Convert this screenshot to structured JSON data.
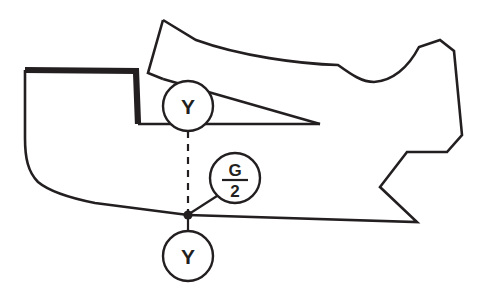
{
  "diagram": {
    "type": "technical-pattern-drawing",
    "background_color": "#ffffff",
    "line_color": "#231f20",
    "callouts": [
      {
        "id": "upper-notch",
        "label": "Y",
        "shape": "circle",
        "center": {
          "x": 188,
          "y": 106
        },
        "radius": 25
      },
      {
        "id": "grainline-half",
        "label_numerator": "G",
        "label_denominator": "2",
        "shape": "circle",
        "center": {
          "x": 235,
          "y": 178
        },
        "radius": 25
      },
      {
        "id": "lower-notch",
        "label": "Y",
        "shape": "circle",
        "center": {
          "x": 188,
          "y": 256
        },
        "radius": 25
      }
    ],
    "connectors": [
      {
        "id": "vertical-dashed",
        "style": "dashed",
        "from": {
          "x": 188,
          "y": 131
        },
        "to": {
          "x": 188,
          "y": 215
        }
      },
      {
        "id": "grain-leader",
        "style": "solid",
        "from": {
          "x": 217,
          "y": 196
        },
        "to": {
          "x": 188,
          "y": 215
        }
      },
      {
        "id": "lower-stem",
        "style": "solid",
        "from": {
          "x": 188,
          "y": 215
        },
        "to": {
          "x": 188,
          "y": 231
        }
      }
    ],
    "node_points": [
      {
        "id": "balance-point",
        "x": 188,
        "y": 215,
        "radius": 4.5
      }
    ]
  }
}
